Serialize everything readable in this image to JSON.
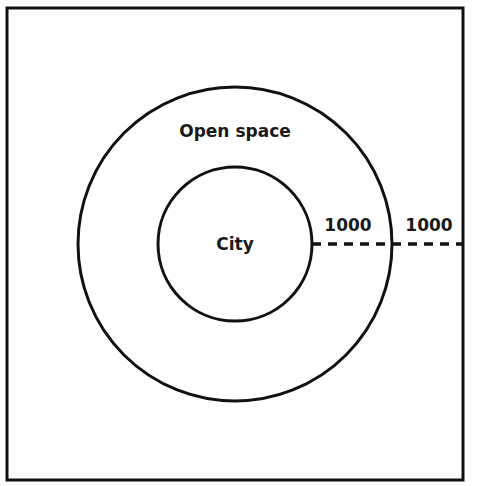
{
  "diagram": {
    "regions": {
      "city": {
        "label": "City"
      },
      "open_space": {
        "label": "Open space"
      }
    },
    "distances": {
      "city_radius_label": "1000",
      "open_space_width_label": "1000"
    },
    "colors": {
      "stroke": "#111111",
      "background": "#ffffff"
    }
  }
}
